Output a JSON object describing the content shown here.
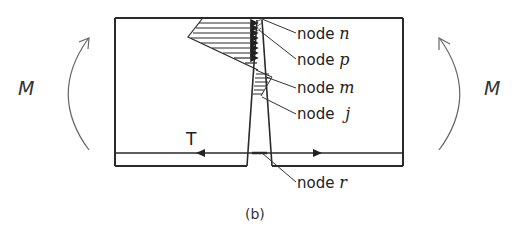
{
  "figure": {
    "caption": "(b)",
    "colors": {
      "stroke": "#2a2a2a",
      "arrow": "#555555",
      "text": "#222222"
    }
  },
  "moments": {
    "left": {
      "label": "M",
      "direction": "counterclockwise-up"
    },
    "right": {
      "label": "M",
      "direction": "clockwise-up"
    }
  },
  "tension": {
    "label": "T"
  },
  "nodes": [
    {
      "word": "node",
      "symbol": "n"
    },
    {
      "word": "node",
      "symbol": "p"
    },
    {
      "word": "node",
      "symbol": "m"
    },
    {
      "word": "node",
      "symbol": "j"
    },
    {
      "word": "node",
      "symbol": "r"
    }
  ]
}
